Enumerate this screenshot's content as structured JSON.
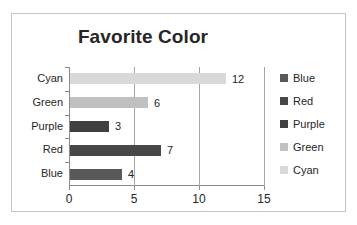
{
  "chart_data": {
    "type": "bar",
    "orientation": "horizontal",
    "title": "Favorite Color",
    "xlabel": "",
    "ylabel": "",
    "categories": [
      "Blue",
      "Red",
      "Purple",
      "Green",
      "Cyan"
    ],
    "values": [
      4,
      7,
      3,
      6,
      12
    ],
    "data_labels": [
      "4",
      "7",
      "3",
      "6",
      "12"
    ],
    "xlim": [
      0,
      15
    ],
    "xticks": [
      0,
      5,
      10,
      15
    ],
    "xtick_labels": [
      "0",
      "5",
      "10",
      "15"
    ],
    "grid": "vertical",
    "legend_position": "right",
    "legend": [
      {
        "label": "Blue",
        "color": "#595959"
      },
      {
        "label": "Red",
        "color": "#484848"
      },
      {
        "label": "Purple",
        "color": "#404040"
      },
      {
        "label": "Green",
        "color": "#c0c0c0"
      },
      {
        "label": "Cyan",
        "color": "#d9d9d9"
      }
    ],
    "series": [
      {
        "name": "Blue",
        "value": 4,
        "color": "#595959"
      },
      {
        "name": "Red",
        "value": 7,
        "color": "#484848"
      },
      {
        "name": "Purple",
        "value": 3,
        "color": "#404040"
      },
      {
        "name": "Green",
        "value": 6,
        "color": "#c0c0c0"
      },
      {
        "name": "Cyan",
        "value": 12,
        "color": "#d9d9d9"
      }
    ],
    "colors": {
      "plot_border": "#c6c6c6",
      "axis": "#8c8c8c",
      "gridline": "#a6a6a6",
      "text": "#262626",
      "background": "#ffffff"
    }
  }
}
